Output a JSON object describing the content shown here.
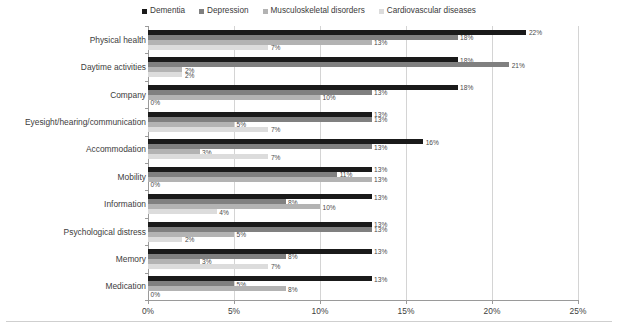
{
  "chart_data": {
    "type": "bar",
    "orientation": "horizontal",
    "title": "",
    "xlabel": "",
    "ylabel": "",
    "xlim": [
      0,
      25
    ],
    "xticks": [
      0,
      5,
      10,
      15,
      20,
      25
    ],
    "xtick_labels": [
      "0%",
      "5%",
      "10%",
      "15%",
      "20%",
      "25%"
    ],
    "grid": true,
    "legend_position": "top-center",
    "value_suffix": "%",
    "categories": [
      "Physical health",
      "Daytime activities",
      "Company",
      "Eyesight/hearing/communication",
      "Accommodation",
      "Mobility",
      "Information",
      "Psychological distress",
      "Memory",
      "Medication"
    ],
    "series": [
      {
        "name": "Dementia",
        "color": "#1a1a1a",
        "values": [
          22,
          18,
          18,
          13,
          16,
          13,
          13,
          13,
          13,
          13
        ],
        "labels": [
          "22%",
          "18%",
          "18%",
          "13%",
          "16%",
          "13%",
          "13%",
          "13%",
          "13%",
          "13%"
        ]
      },
      {
        "name": "Depression",
        "color": "#808080",
        "values": [
          18,
          21,
          13,
          13,
          13,
          11,
          8,
          13,
          8,
          5
        ],
        "labels": [
          "18%",
          "21%",
          "13%",
          "13%",
          "13%",
          "11%",
          "8%",
          "13%",
          "8%",
          "5%"
        ]
      },
      {
        "name": "Musculoskeletal disorders",
        "color": "#b3b3b3",
        "values": [
          13,
          2,
          10,
          5,
          3,
          13,
          10,
          5,
          3,
          8
        ],
        "labels": [
          "13%",
          "2%",
          "10%",
          "5%",
          "3%",
          "13%",
          "10%",
          "5%",
          "3%",
          "8%"
        ]
      },
      {
        "name": "Cardiovascular diseases",
        "color": "#dcdcdc",
        "values": [
          7,
          2,
          0,
          7,
          7,
          0,
          4,
          2,
          7,
          0
        ],
        "labels": [
          "7%",
          "2%",
          "0%",
          "7%",
          "7%",
          "0%",
          "4%",
          "2%",
          "7%",
          "0%"
        ]
      }
    ]
  }
}
